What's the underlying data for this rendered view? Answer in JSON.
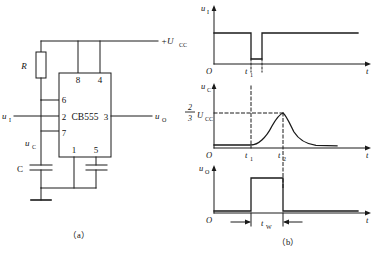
{
  "figure": {
    "subcaption_a": "（a）",
    "subcaption_b": "（b）"
  },
  "circuit": {
    "chip_label": "CB555",
    "supply_label": "+U",
    "supply_sub": "CC",
    "resistor_label": "R",
    "capacitor_label": "C",
    "input_label": "u",
    "input_sub": "I",
    "output_label": "u",
    "output_sub": "O",
    "cap_node_label": "u",
    "cap_node_sub": "C",
    "pins": {
      "top": [
        "8",
        "4"
      ],
      "left": [
        "6",
        "2",
        "7"
      ],
      "right": [
        "3"
      ],
      "bottom": [
        "1",
        "5"
      ]
    }
  },
  "waveforms": {
    "trigger": {
      "y_label": "u",
      "y_sub": "I",
      "origin_label": "O",
      "x_label": "t",
      "tick_labels": [
        "t"
      ],
      "tick_subs": [
        "1"
      ]
    },
    "capacitor": {
      "y_label": "u",
      "y_sub": "C",
      "origin_label": "O",
      "x_label": "t",
      "threshold_numer": "2",
      "threshold_denom": "3",
      "threshold_label": "U",
      "threshold_sub": "CC",
      "tick_labels": [
        "t",
        "t"
      ],
      "tick_subs": [
        "1",
        "2"
      ]
    },
    "output": {
      "y_label": "u",
      "y_sub": "O",
      "origin_label": "O",
      "x_label": "t",
      "width_label": "t",
      "width_sub": "W"
    }
  },
  "colors": {
    "line": "#1a1a1a",
    "dashed": "#1a1a1a",
    "background": "#ffffff"
  }
}
